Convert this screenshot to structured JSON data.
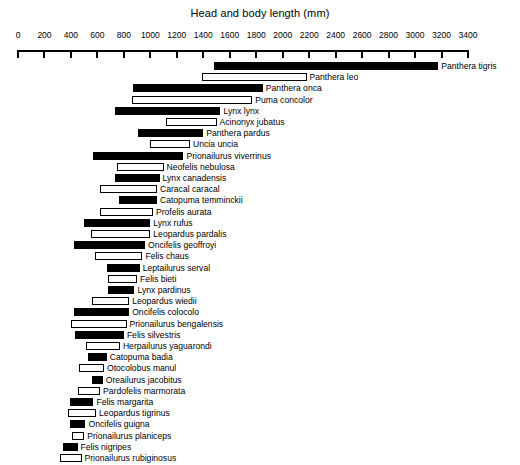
{
  "chart_data": {
    "type": "bar",
    "subtype": "horizontal-range-bar",
    "title": "Head and body length (mm)",
    "xlabel": "Head and body length (mm)",
    "ylabel": "",
    "xlim": [
      0,
      3400
    ],
    "xticks": [
      0,
      200,
      400,
      600,
      800,
      1000,
      1200,
      1400,
      1600,
      1800,
      2000,
      2200,
      2400,
      2600,
      2800,
      3000,
      3200,
      3400
    ],
    "xtick_labels": [
      "0",
      "200",
      "400",
      "600",
      "800",
      "1000",
      "1200",
      "1400",
      "1600",
      "1800",
      "2000",
      "2200",
      "2400",
      "2600",
      "2800",
      "3000",
      "3200",
      "3400"
    ],
    "grid": false,
    "legend": null,
    "categories": [
      "Panthera tigris",
      "Panthera leo",
      "Panthera onca",
      "Puma concolor",
      "Lynx lynx",
      "Acinonyx jubatus",
      "Panthera pardus",
      "Uncia uncia",
      "Prionailurus viverrinus",
      "Neofelis nebulosa",
      "Lynx canadensis",
      "Caracal caracal",
      "Catopuma temminckii",
      "Profelis aurata",
      "Lynx rufus",
      "Leopardus pardalis",
      "Oncifelis geoffroyi",
      "Felis chaus",
      "Leptailurus serval",
      "Felis bieti",
      "Lynx pardinus",
      "Leopardus wiedii",
      "Oncifelis colocolo",
      "Prionailurus bengalensis",
      "Felis silvestris",
      "Herpailurus yaguarondi",
      "Catopuma badia",
      "Otocolobus manul",
      "Oreailurus jacobitus",
      "Pardofelis marmorata",
      "Felis margarita",
      "Leopardus tigrinus",
      "Oncifelis guigna",
      "Prionailurus planiceps",
      "Felis nigripes",
      "Prionailurus rubiginosus"
    ],
    "bars": [
      {
        "name": "Panthera tigris",
        "min": 1480,
        "max": 3175,
        "style": "filled"
      },
      {
        "name": "Panthera leo",
        "min": 1390,
        "max": 2180,
        "style": "open"
      },
      {
        "name": "Panthera onca",
        "min": 870,
        "max": 1850,
        "style": "filled"
      },
      {
        "name": "Puma concolor",
        "min": 860,
        "max": 1770,
        "style": "open"
      },
      {
        "name": "Lynx lynx",
        "min": 730,
        "max": 1530,
        "style": "filled"
      },
      {
        "name": "Acinonyx jubatus",
        "min": 1120,
        "max": 1500,
        "style": "open"
      },
      {
        "name": "Panthera pardus",
        "min": 910,
        "max": 1400,
        "style": "filled"
      },
      {
        "name": "Uncia uncia",
        "min": 1000,
        "max": 1300,
        "style": "open"
      },
      {
        "name": "Prionailurus viverrinus",
        "min": 570,
        "max": 1250,
        "style": "filled"
      },
      {
        "name": "Neofelis nebulosa",
        "min": 750,
        "max": 1100,
        "style": "open"
      },
      {
        "name": "Lynx canadensis",
        "min": 730,
        "max": 1070,
        "style": "filled"
      },
      {
        "name": "Caracal caracal",
        "min": 620,
        "max": 1050,
        "style": "open"
      },
      {
        "name": "Catopuma temminckii",
        "min": 760,
        "max": 1050,
        "style": "filled"
      },
      {
        "name": "Profelis aurata",
        "min": 620,
        "max": 1020,
        "style": "open"
      },
      {
        "name": "Lynx rufus",
        "min": 500,
        "max": 1000,
        "style": "filled"
      },
      {
        "name": "Leopardus pardalis",
        "min": 550,
        "max": 1000,
        "style": "open"
      },
      {
        "name": "Oncifelis geoffroyi",
        "min": 420,
        "max": 960,
        "style": "filled"
      },
      {
        "name": "Felis chaus",
        "min": 580,
        "max": 940,
        "style": "open"
      },
      {
        "name": "Leptailurus serval",
        "min": 670,
        "max": 920,
        "style": "filled"
      },
      {
        "name": "Felis bieti",
        "min": 680,
        "max": 900,
        "style": "open"
      },
      {
        "name": "Lynx pardinus",
        "min": 680,
        "max": 880,
        "style": "filled"
      },
      {
        "name": "Leopardus wiedii",
        "min": 560,
        "max": 840,
        "style": "open"
      },
      {
        "name": "Oncifelis colocolo",
        "min": 420,
        "max": 840,
        "style": "filled"
      },
      {
        "name": "Prionailurus bengalensis",
        "min": 400,
        "max": 820,
        "style": "open"
      },
      {
        "name": "Felis silvestris",
        "min": 430,
        "max": 800,
        "style": "filled"
      },
      {
        "name": "Herpailurus yaguarondi",
        "min": 510,
        "max": 770,
        "style": "open"
      },
      {
        "name": "Catopuma badia",
        "min": 530,
        "max": 670,
        "style": "filled"
      },
      {
        "name": "Otocolobus manul",
        "min": 460,
        "max": 650,
        "style": "open"
      },
      {
        "name": "Oreailurus jacobitus",
        "min": 560,
        "max": 640,
        "style": "filled"
      },
      {
        "name": "Pardofelis marmorata",
        "min": 450,
        "max": 620,
        "style": "open"
      },
      {
        "name": "Felis margarita",
        "min": 390,
        "max": 570,
        "style": "filled"
      },
      {
        "name": "Leopardus tigrinus",
        "min": 380,
        "max": 590,
        "style": "open"
      },
      {
        "name": "Oncifelis guigna",
        "min": 390,
        "max": 510,
        "style": "filled"
      },
      {
        "name": "Prionailurus planiceps",
        "min": 410,
        "max": 500,
        "style": "open"
      },
      {
        "name": "Felis nigripes",
        "min": 337,
        "max": 450,
        "style": "filled"
      },
      {
        "name": "Prionailurus rubiginosus",
        "min": 320,
        "max": 480,
        "style": "open"
      }
    ]
  },
  "caption": {
    "sliver_text": ""
  }
}
